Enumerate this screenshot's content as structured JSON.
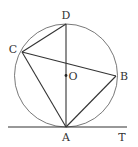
{
  "diagram": {
    "type": "geometry-circle-tangent",
    "circle": {
      "cx": 66,
      "cy": 75.5,
      "r": 51.5,
      "stroke": "#555555"
    },
    "points": {
      "D": {
        "x": 66,
        "y": 24,
        "label": "D",
        "lx": 66,
        "ly": 19
      },
      "C": {
        "x": 22,
        "y": 52,
        "label": "C",
        "lx": 13,
        "ly": 53
      },
      "B": {
        "x": 116,
        "y": 76,
        "label": "B",
        "lx": 124,
        "ly": 80
      },
      "A": {
        "x": 66,
        "y": 127,
        "label": "A",
        "lx": 66,
        "ly": 141
      },
      "O": {
        "x": 66,
        "y": 75.5,
        "label": "O",
        "lx": 73,
        "ly": 80
      },
      "T": {
        "x": 122,
        "y": 127,
        "label": "T",
        "lx": 122,
        "ly": 141
      }
    },
    "segments": [
      [
        "D",
        "A"
      ],
      [
        "C",
        "D"
      ],
      [
        "C",
        "B"
      ],
      [
        "C",
        "A"
      ],
      [
        "B",
        "A"
      ]
    ],
    "tangent_line": {
      "x1": 8,
      "y1": 127,
      "x2": 127,
      "y2": 127
    },
    "line_color": "#333333"
  }
}
